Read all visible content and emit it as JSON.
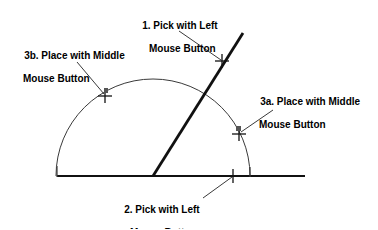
{
  "figure": {
    "background_color": "#ffffff",
    "ink_color": "#000000",
    "thin_line_color": "#333333",
    "annotations": {
      "pick_left_1": {
        "line1": "1. Pick with Left",
        "line2": "Mouse Button"
      },
      "place_middle_3b": {
        "line1": "3b. Place with Middle",
        "line2": "Mouse Button"
      },
      "place_middle_3a": {
        "line1": "3a. Place with Middle",
        "line2": "Mouse Button"
      },
      "pick_left_2": {
        "line1": "2. Pick with Left",
        "line2": "Mouse Button"
      }
    },
    "geometry": {
      "baseline": {
        "x1": 57,
        "y1": 176,
        "x2": 305,
        "y2": 176
      },
      "arc": {
        "cx": 153,
        "cy": 176,
        "r": 97,
        "start_deg": 180,
        "end_deg": 0
      },
      "diagonal": {
        "x1": 153,
        "y1": 176,
        "x2": 243,
        "y2": 33
      },
      "left_tick": {
        "x": 57,
        "y_top": 166,
        "y_bottom": 176
      },
      "right_tick": {
        "x": 250,
        "y_top": 167,
        "y_bottom": 176
      },
      "markers": [
        {
          "name": "marker-pick-1",
          "x": 222,
          "y": 61
        },
        {
          "name": "marker-place-3b",
          "x": 105,
          "y": 95
        },
        {
          "name": "marker-place-3a",
          "x": 239,
          "y": 133
        },
        {
          "name": "marker-pick-2",
          "x": 233,
          "y": 176
        }
      ],
      "leaders": [
        {
          "name": "leader-pick-1",
          "x1": 179,
          "y1": 31,
          "x2": 221,
          "y2": 60
        },
        {
          "name": "leader-place-3b",
          "x1": 77,
          "y1": 62,
          "x2": 104,
          "y2": 94
        },
        {
          "name": "leader-place-3a",
          "x1": 273,
          "y1": 110,
          "x2": 241,
          "y2": 132
        },
        {
          "name": "leader-pick-2",
          "x1": 203,
          "y1": 198,
          "x2": 232,
          "y2": 177
        }
      ]
    }
  }
}
